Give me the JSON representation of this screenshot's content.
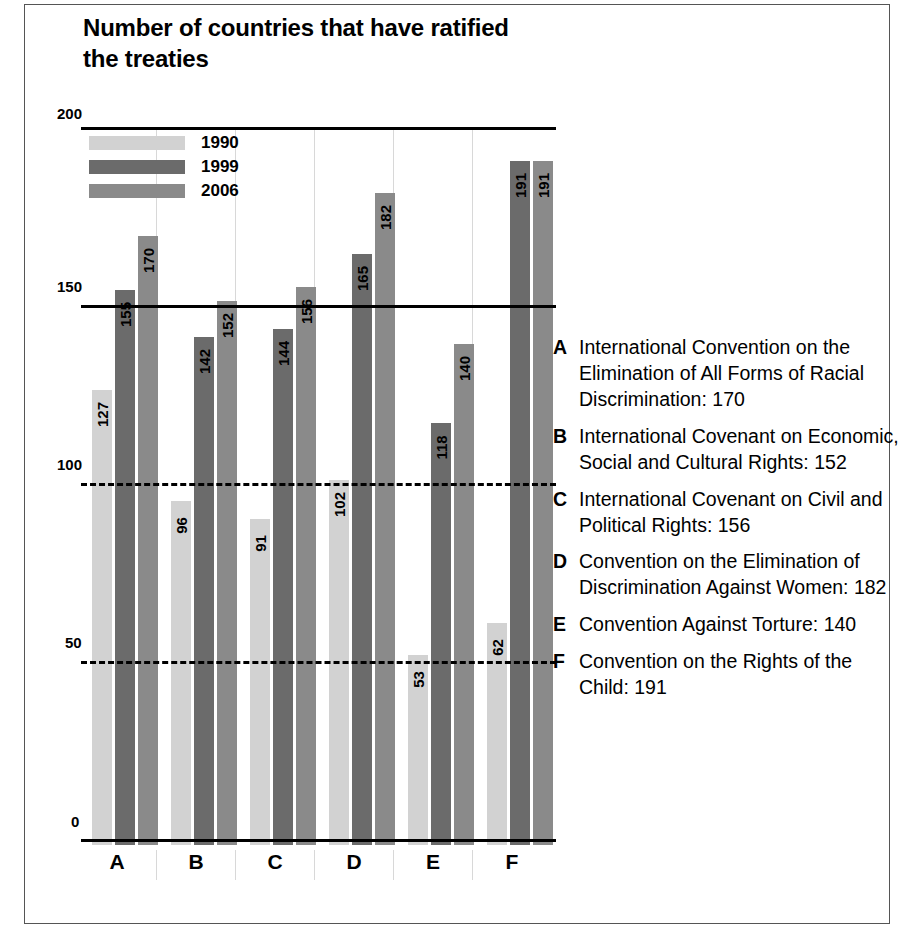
{
  "title": "Number of countries that have ratified the treaties",
  "series_legend": [
    {
      "label": "1990",
      "color": "#d2d2d2"
    },
    {
      "label": "1999",
      "color": "#6b6b6b"
    },
    {
      "label": "2006",
      "color": "#8a8a8a"
    }
  ],
  "key": [
    {
      "letter": "A",
      "text": "International Convention on the Elimination of All Forms of Racial Discrimination: 170"
    },
    {
      "letter": "B",
      "text": "International Covenant on Economic, Social and Cultural Rights: 152"
    },
    {
      "letter": "C",
      "text": "International Covenant on Civil and Political Rights: 156"
    },
    {
      "letter": "D",
      "text": "Convention on the Elimination of Discrimination Against Women: 182"
    },
    {
      "letter": "E",
      "text": "Convention Against Torture: 140"
    },
    {
      "letter": "F",
      "text": "Convention on the Rights of the Child: 191"
    }
  ],
  "chart_data": {
    "type": "bar",
    "title": "Number of countries that have ratified the treaties",
    "xlabel": "",
    "ylabel": "",
    "ylim": [
      0,
      200
    ],
    "yticks": [
      0,
      50,
      100,
      150,
      200
    ],
    "grid": true,
    "legend_position": "top-left",
    "categories": [
      "A",
      "B",
      "C",
      "D",
      "E",
      "F"
    ],
    "series": [
      {
        "name": "1990",
        "color": "#d2d2d2",
        "values": [
          127,
          96,
          91,
          102,
          53,
          62
        ]
      },
      {
        "name": "1999",
        "color": "#6b6b6b",
        "values": [
          155,
          142,
          144,
          165,
          118,
          191
        ]
      },
      {
        "name": "2006",
        "color": "#8a8a8a",
        "values": [
          170,
          152,
          156,
          182,
          140,
          191
        ]
      }
    ]
  }
}
